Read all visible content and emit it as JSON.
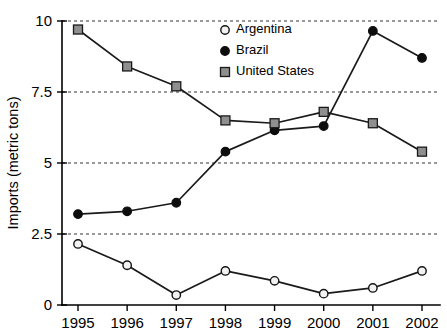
{
  "chart_data": {
    "type": "line",
    "title": "",
    "subtitle": "",
    "xlabel": "",
    "ylabel": "Imports (metric tons)",
    "categories": [
      "1995",
      "1996",
      "1997",
      "1998",
      "1999",
      "2000",
      "2001",
      "2002"
    ],
    "x": [
      1995,
      1996,
      1997,
      1998,
      1999,
      2000,
      2001,
      2002
    ],
    "series": [
      {
        "name": "Argentina",
        "marker": "open-circle",
        "color": "#f2f2f2",
        "line_color": "#1a1a1a",
        "values": [
          2.15,
          1.4,
          0.35,
          1.2,
          0.85,
          0.4,
          0.6,
          1.2
        ]
      },
      {
        "name": "Brazil",
        "marker": "filled-circle",
        "color": "#0d0d0d",
        "line_color": "#1a1a1a",
        "values": [
          3.2,
          3.3,
          3.6,
          5.4,
          6.15,
          6.3,
          9.65,
          8.7
        ]
      },
      {
        "name": "United States",
        "marker": "gray-square",
        "color": "#8f8f8f",
        "line_color": "#1a1a1a",
        "values": [
          9.7,
          8.4,
          7.7,
          6.5,
          6.4,
          6.8,
          6.4,
          5.4
        ]
      }
    ],
    "ylim": [
      0,
      10
    ],
    "yticks": [
      0,
      2.5,
      5,
      7.5,
      10
    ],
    "ytick_labels": [
      "0",
      "2.5",
      "5",
      "7.5",
      "10"
    ],
    "xtick_labels": [
      "1995",
      "1996",
      "1997",
      "1998",
      "1999",
      "2000",
      "2001",
      "2002"
    ],
    "grid": {
      "horizontal": true,
      "vertical": false,
      "style": "dashed",
      "color": "#333333"
    },
    "legend": {
      "position": "top-center-right",
      "entries": [
        {
          "label": "Argentina",
          "marker": "open-circle"
        },
        {
          "label": "Brazil",
          "marker": "filled-circle"
        },
        {
          "label": "United States",
          "marker": "gray-square"
        }
      ]
    }
  }
}
